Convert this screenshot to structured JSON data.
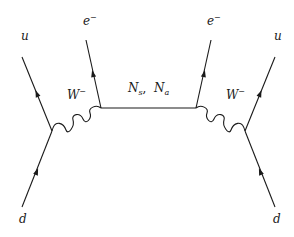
{
  "diagram": {
    "type": "feynman-diagram",
    "labels": {
      "u_left": {
        "base": "u",
        "sup": ""
      },
      "d_left": {
        "base": "d",
        "sup": ""
      },
      "e_left": {
        "base": "e",
        "sup": "−"
      },
      "w_left": {
        "base": "W",
        "sup": "−"
      },
      "propagator": {
        "n_s_base": "N",
        "n_s_sub": "s",
        "sep": ",  ",
        "n_a_base": "N",
        "n_a_sub": "a"
      },
      "e_right": {
        "base": "e",
        "sup": "−"
      },
      "w_right": {
        "base": "W",
        "sup": "−"
      },
      "u_right": {
        "base": "u",
        "sup": ""
      },
      "d_right": {
        "base": "d",
        "sup": ""
      }
    },
    "vertices": {
      "left_quark": [
        52,
        131
      ],
      "left_lepton": [
        101,
        108
      ],
      "right_lepton": [
        196,
        108
      ],
      "right_quark": [
        245,
        131
      ]
    },
    "line_color": "#1a1a1a",
    "background": "#ffffff"
  }
}
